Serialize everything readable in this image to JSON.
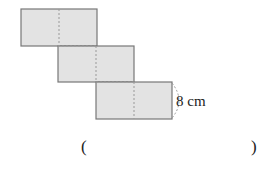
{
  "diagram": {
    "type": "cube-net",
    "fill_color": "#e3e3e3",
    "stroke_color": "#777777",
    "dash_color": "#999999",
    "rectangles": [
      {
        "x": 21,
        "y": 9,
        "w": 76,
        "h": 37,
        "split_x": 59
      },
      {
        "x": 58,
        "y": 46,
        "w": 76,
        "h": 36,
        "split_x": 96
      },
      {
        "x": 96,
        "y": 82,
        "w": 76,
        "h": 37,
        "split_x": 134
      }
    ],
    "dimension_label": "8 cm"
  },
  "answer": {
    "open_paren": "(",
    "close_paren": ")"
  }
}
